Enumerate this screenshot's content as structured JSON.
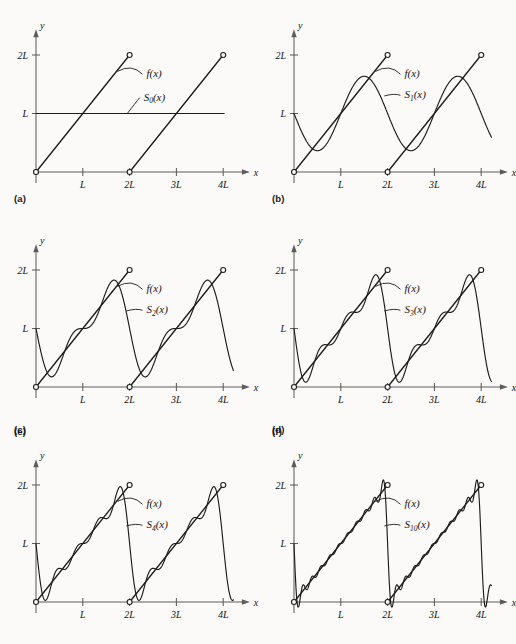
{
  "figure": {
    "background_color": "#fbfaf8",
    "ink_color": "#1c1c1c",
    "axis_color": "#5d5d5d"
  },
  "axes": {
    "x_label": "x",
    "y_label": "y",
    "x_ticks": [
      "L",
      "2L",
      "3L",
      "4L"
    ],
    "y_ticks": [
      "L",
      "2L"
    ]
  },
  "panels": [
    {
      "key": "a",
      "label": "(a)",
      "f_label": "f(x)",
      "s_label": "S",
      "s_sub": "0",
      "s_suffix": "(x)",
      "n_terms": 0
    },
    {
      "key": "b",
      "label": "(b)",
      "f_label": "f(x)",
      "s_label": "S",
      "s_sub": "1",
      "s_suffix": "(x)",
      "n_terms": 1
    },
    {
      "key": "c",
      "label": "(c)",
      "f_label": "f(x)",
      "s_label": "S",
      "s_sub": "2",
      "s_suffix": "(x)",
      "n_terms": 2
    },
    {
      "key": "d",
      "label": "(d)",
      "f_label": "f(x)",
      "s_label": "S",
      "s_sub": "3",
      "s_suffix": "(x)",
      "n_terms": 3
    },
    {
      "key": "e",
      "label": "(e)",
      "f_label": "f(x)",
      "s_label": "S",
      "s_sub": "4",
      "s_suffix": "(x)",
      "n_terms": 4
    },
    {
      "key": "f",
      "label": "(f)",
      "f_label": "f(x)",
      "s_label": "S",
      "s_sub": "10",
      "s_suffix": "(x)",
      "n_terms": 10
    }
  ],
  "chart_data": {
    "type": "line",
    "title": "",
    "xlabel": "x",
    "ylabel": "y",
    "xlim": [
      0,
      4.3
    ],
    "ylim": [
      -0.25,
      2.3
    ],
    "xtick_values": [
      1,
      2,
      3,
      4
    ],
    "xtick_labels": [
      "L",
      "2L",
      "3L",
      "4L"
    ],
    "ytick_values": [
      1,
      2
    ],
    "ytick_labels": [
      "L",
      "2L"
    ],
    "grid": false,
    "legend": "inline-annotations",
    "units": "x measured in units of L; y measured in units of L",
    "series": [
      {
        "name": "f(x)",
        "kind": "sawtooth",
        "formula": "f(x) = 2*(x mod 2L) for 0 <= x mod 2L < 2L, period 2L",
        "period": 2,
        "amplitude": 2,
        "open_points": [
          [
            0,
            0
          ],
          [
            2,
            2
          ],
          [
            2,
            0
          ],
          [
            4,
            2
          ]
        ],
        "segments": [
          {
            "from": [
              0,
              0
            ],
            "to": [
              2,
              2
            ]
          },
          {
            "from": [
              2,
              0
            ],
            "to": [
              4,
              2
            ]
          }
        ]
      },
      {
        "name": "S_0(x)",
        "panel": "a",
        "formula": "S_0(x) = L",
        "n_terms": 0,
        "constant": 1
      },
      {
        "name": "S_1(x)",
        "panel": "b",
        "formula": "S_1(x) = L - (2L/pi)*sin(pi*x/L)",
        "n_terms": 1
      },
      {
        "name": "S_2(x)",
        "panel": "c",
        "formula": "S_2(x) = L - (2L/pi)*[sin(pi*x/L) + (1/2)sin(2pi*x/L)]",
        "n_terms": 2
      },
      {
        "name": "S_3(x)",
        "panel": "d",
        "formula": "S_3(x) = L - (2L/pi)*sum_{k=1}^{3} sin(k*pi*x/L)/k",
        "n_terms": 3
      },
      {
        "name": "S_4(x)",
        "panel": "e",
        "formula": "S_4(x) = L - (2L/pi)*sum_{k=1}^{4} sin(k*pi*x/L)/k",
        "n_terms": 4
      },
      {
        "name": "S_10(x)",
        "panel": "f",
        "formula": "S_10(x) = L - (2L/pi)*sum_{k=1}^{10} sin(k*pi*x/L)/k",
        "n_terms": 10
      }
    ]
  }
}
